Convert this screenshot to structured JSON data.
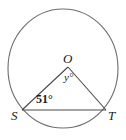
{
  "figure": {
    "type": "circle-with-inscribed-central-angle",
    "background_color": "#ffffff",
    "stroke_color": "#6e6e6e",
    "text_color": "#1a1a1a",
    "circle": {
      "center_x": 63,
      "center_y": 68.5,
      "radius_x": 55,
      "radius_y": 59.5
    },
    "points": {
      "O": {
        "x": 68,
        "y": 67
      },
      "S": {
        "x": 22,
        "y": 110
      },
      "T": {
        "x": 106,
        "y": 110
      }
    },
    "labels": {
      "center_point": "O",
      "angle_at_center": "y°",
      "angle_at_S": "51°",
      "left_point": "S",
      "right_point": "T"
    }
  }
}
